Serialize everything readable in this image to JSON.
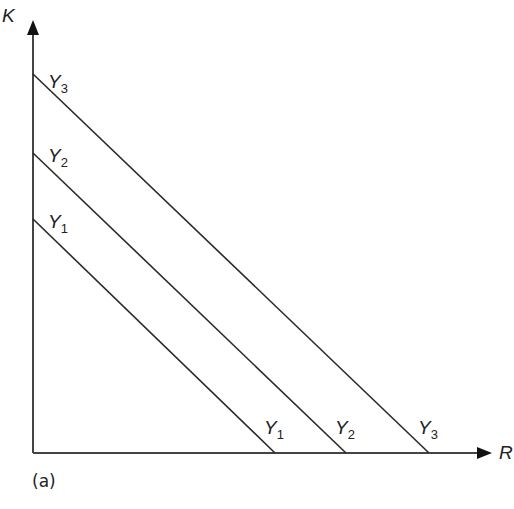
{
  "diagram": {
    "panel_label": "(a)",
    "axes": {
      "y_label": "K",
      "x_label": "R"
    },
    "lines": [
      {
        "name": "Y",
        "sub": "1",
        "y_intercept_px": 219,
        "x_intercept_px": 275
      },
      {
        "name": "Y",
        "sub": "2",
        "y_intercept_px": 153,
        "x_intercept_px": 346
      },
      {
        "name": "Y",
        "sub": "3",
        "y_intercept_px": 74,
        "x_intercept_px": 429
      }
    ],
    "colors": {
      "line": "#2a2a2a",
      "text": "#222222"
    }
  }
}
